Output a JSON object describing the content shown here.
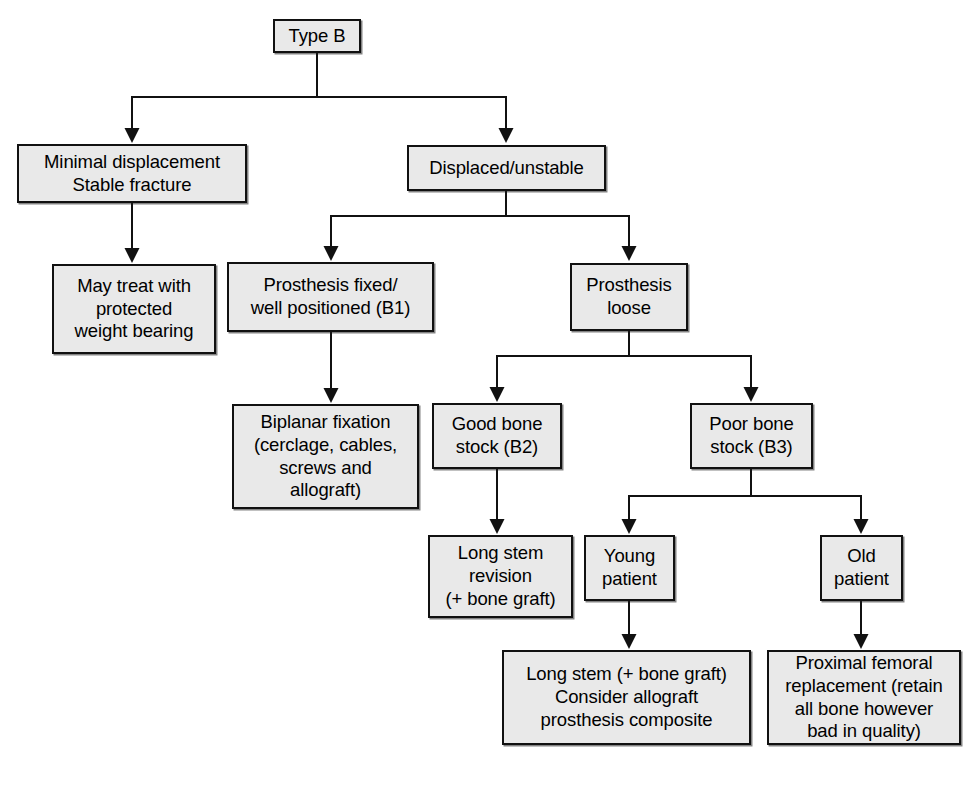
{
  "diagram": {
    "root_label": "Type B",
    "style": {
      "box_fill": "#e9e9e9",
      "box_border": "#111111",
      "text_color": "#000000",
      "connector_color": "#111111",
      "background": "#ffffff"
    }
  },
  "nodes": [
    {
      "id": "type-b",
      "name": "node-type-b",
      "lines": [
        "Type B"
      ],
      "x": 273,
      "y": 19,
      "w": 88,
      "h": 34
    },
    {
      "id": "minimal-displacement",
      "name": "node-minimal-displacement-stable-fracture",
      "lines": [
        "Minimal displacement",
        "Stable fracture"
      ],
      "x": 17,
      "y": 144,
      "w": 230,
      "h": 59
    },
    {
      "id": "displaced-unstable",
      "name": "node-displaced-unstable",
      "lines": [
        "Displaced/unstable"
      ],
      "x": 407,
      "y": 145,
      "w": 199,
      "h": 46
    },
    {
      "id": "may-treat",
      "name": "node-may-treat-protected-weight-bearing",
      "lines": [
        "May treat with",
        "protected",
        "weight bearing"
      ],
      "x": 52,
      "y": 264,
      "w": 164,
      "h": 90
    },
    {
      "id": "prosthesis-fixed",
      "name": "node-prosthesis-fixed-well-positioned-b1",
      "lines": [
        "Prosthesis fixed/",
        "well positioned (B1)"
      ],
      "x": 227,
      "y": 262,
      "w": 207,
      "h": 70
    },
    {
      "id": "prosthesis-loose",
      "name": "node-prosthesis-loose",
      "lines": [
        "Prosthesis",
        "loose"
      ],
      "x": 570,
      "y": 263,
      "w": 118,
      "h": 68
    },
    {
      "id": "biplanar-fixation",
      "name": "node-biplanar-fixation",
      "lines": [
        "Biplanar fixation",
        "(cerclage, cables,",
        "screws and",
        "allograft)"
      ],
      "x": 232,
      "y": 404,
      "w": 187,
      "h": 105
    },
    {
      "id": "good-bone-stock",
      "name": "node-good-bone-stock-b2",
      "lines": [
        "Good bone",
        "stock (B2)"
      ],
      "x": 432,
      "y": 403,
      "w": 130,
      "h": 66
    },
    {
      "id": "poor-bone-stock",
      "name": "node-poor-bone-stock-b3",
      "lines": [
        "Poor bone",
        "stock (B3)"
      ],
      "x": 690,
      "y": 403,
      "w": 123,
      "h": 66
    },
    {
      "id": "long-stem-revision",
      "name": "node-long-stem-revision-bone-graft",
      "lines": [
        "Long stem",
        "revision",
        "(+ bone graft)"
      ],
      "x": 428,
      "y": 535,
      "w": 145,
      "h": 83
    },
    {
      "id": "young-patient",
      "name": "node-young-patient",
      "lines": [
        "Young",
        "patient"
      ],
      "x": 584,
      "y": 535,
      "w": 91,
      "h": 66
    },
    {
      "id": "old-patient",
      "name": "node-old-patient",
      "lines": [
        "Old",
        "patient"
      ],
      "x": 820,
      "y": 535,
      "w": 83,
      "h": 66
    },
    {
      "id": "long-stem-allograft",
      "name": "node-long-stem-consider-allograft-prosthesis-composite",
      "lines": [
        "Long stem (+ bone graft)",
        "Consider allograft",
        "prosthesis composite"
      ],
      "x": 502,
      "y": 650,
      "w": 249,
      "h": 95
    },
    {
      "id": "proximal-femoral-replacement",
      "name": "node-proximal-femoral-replacement",
      "lines": [
        "Proximal femoral",
        "replacement (retain",
        "all bone however",
        "bad in quality)"
      ],
      "x": 767,
      "y": 650,
      "w": 194,
      "h": 95
    }
  ],
  "edges": [
    {
      "name": "edge-type-b-to-split",
      "from": "type-b",
      "to": "split-1",
      "kind": "split"
    },
    {
      "name": "edge-split-to-minimal-displacement",
      "from": "split-1",
      "to": "minimal-displacement",
      "kind": "arrow"
    },
    {
      "name": "edge-split-to-displaced-unstable",
      "from": "split-1",
      "to": "displaced-unstable",
      "kind": "arrow"
    },
    {
      "name": "edge-minimal-displacement-to-may-treat",
      "from": "minimal-displacement",
      "to": "may-treat",
      "kind": "arrow"
    },
    {
      "name": "edge-displaced-unstable-to-split",
      "from": "displaced-unstable",
      "to": "split-2",
      "kind": "split"
    },
    {
      "name": "edge-split-to-prosthesis-fixed",
      "from": "split-2",
      "to": "prosthesis-fixed",
      "kind": "arrow"
    },
    {
      "name": "edge-split-to-prosthesis-loose",
      "from": "split-2",
      "to": "prosthesis-loose",
      "kind": "arrow"
    },
    {
      "name": "edge-prosthesis-fixed-to-biplanar-fixation",
      "from": "prosthesis-fixed",
      "to": "biplanar-fixation",
      "kind": "arrow"
    },
    {
      "name": "edge-prosthesis-loose-to-split",
      "from": "prosthesis-loose",
      "to": "split-3",
      "kind": "split"
    },
    {
      "name": "edge-split-to-good-bone-stock",
      "from": "split-3",
      "to": "good-bone-stock",
      "kind": "arrow"
    },
    {
      "name": "edge-split-to-poor-bone-stock",
      "from": "split-3",
      "to": "poor-bone-stock",
      "kind": "arrow"
    },
    {
      "name": "edge-good-bone-stock-to-long-stem-revision",
      "from": "good-bone-stock",
      "to": "long-stem-revision",
      "kind": "arrow"
    },
    {
      "name": "edge-poor-bone-stock-to-split",
      "from": "poor-bone-stock",
      "to": "split-4",
      "kind": "split"
    },
    {
      "name": "edge-split-to-young-patient",
      "from": "split-4",
      "to": "young-patient",
      "kind": "arrow"
    },
    {
      "name": "edge-split-to-old-patient",
      "from": "split-4",
      "to": "old-patient",
      "kind": "arrow"
    },
    {
      "name": "edge-young-patient-to-long-stem-allograft",
      "from": "young-patient",
      "to": "long-stem-allograft",
      "kind": "arrow"
    },
    {
      "name": "edge-old-patient-to-proximal-femoral-replacement",
      "from": "old-patient",
      "to": "proximal-femoral-replacement",
      "kind": "arrow"
    }
  ],
  "connector_geometry": {
    "split_1": {
      "stem_x": 317,
      "stem_y0": 53,
      "bus_y": 97,
      "left_x": 132,
      "right_x": 506,
      "target_y": 143
    },
    "split_2": {
      "stem_x": 506,
      "stem_y0": 191,
      "bus_y": 216,
      "left_x": 331,
      "right_x": 629,
      "target_y": 261
    },
    "split_3": {
      "stem_x": 629,
      "stem_y0": 331,
      "bus_y": 356,
      "left_x": 497,
      "right_x": 751,
      "target_y": 402
    },
    "split_4": {
      "stem_x": 751,
      "stem_y0": 469,
      "bus_y": 496,
      "left_x": 629,
      "right_x": 861,
      "target_y": 534
    },
    "straight_edges": [
      {
        "x": 132,
        "y0": 203,
        "y1": 263
      },
      {
        "x": 331,
        "y0": 332,
        "y1": 403
      },
      {
        "x": 497,
        "y0": 469,
        "y1": 534
      },
      {
        "x": 629,
        "y0": 601,
        "y1": 649
      },
      {
        "x": 861,
        "y0": 601,
        "y1": 649
      }
    ]
  }
}
